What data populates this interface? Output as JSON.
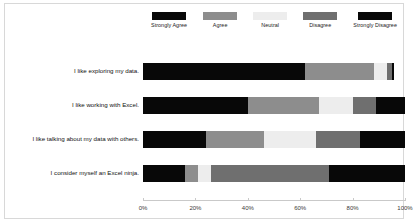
{
  "chart_data": {
    "type": "bar",
    "subtype": "stacked-horizontal-100pct",
    "title": "",
    "xlabel": "",
    "ylabel": "",
    "xlim": [
      0,
      100
    ],
    "grid": false,
    "legend_position": "top",
    "categories": [
      "I like exploring my data.",
      "I like working with Excel.",
      "I like talking about my data with others.",
      "I consider myself an Excel ninja."
    ],
    "series": [
      {
        "name": "Strongly Agree",
        "color": "#080808",
        "values": [
          62,
          40,
          24,
          16
        ]
      },
      {
        "name": "Agree",
        "color": "#8d8d8d",
        "values": [
          26,
          27,
          22,
          5
        ]
      },
      {
        "name": "Neutral",
        "color": "#ededed",
        "values": [
          5,
          13,
          20,
          5
        ]
      },
      {
        "name": "Disagree",
        "color": "#6f6f6f",
        "values": [
          2,
          9,
          17,
          45
        ]
      },
      {
        "name": "Strongly Disagree",
        "color": "#080808",
        "values": [
          1,
          11,
          17,
          29
        ]
      }
    ],
    "xticks": [
      0,
      20,
      40,
      60,
      80,
      100
    ],
    "xtick_labels": [
      "0%",
      "20%",
      "40%",
      "60%",
      "80%",
      "100%"
    ]
  },
  "legend": {
    "items": [
      {
        "label": "Strongly Agree",
        "color": "#080808"
      },
      {
        "label": "Agree",
        "color": "#8d8d8d"
      },
      {
        "label": "Neutral",
        "color": "#ededed"
      },
      {
        "label": "Disagree",
        "color": "#6f6f6f"
      },
      {
        "label": "Strongly Disagree",
        "color": "#080808"
      }
    ]
  }
}
